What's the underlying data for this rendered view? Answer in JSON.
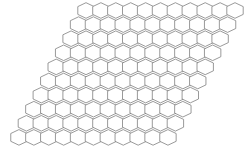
{
  "figure": {
    "background_color": "#ffffff",
    "stroke_color": "#6e6e6e",
    "fill_color": "#ffffff",
    "stroke_width": 0.7
  },
  "chart_data": {
    "type": "diagram",
    "shape": "rhombus",
    "cell_shape": "hexagon",
    "cell_orientation": "flat-top",
    "rows": 10,
    "cols": 11,
    "total_cells": 110,
    "hex_width": 16.4,
    "hex_height": 15.6,
    "row_pitch_y": 14.1,
    "col_pitch_x": 14.9,
    "row_shift_x": -7.45,
    "origin_x": 86.0,
    "origin_y": 10.5,
    "xlim": [
      0,
      249
    ],
    "ylim": [
      0,
      155
    ],
    "grid": false,
    "legend": false
  }
}
